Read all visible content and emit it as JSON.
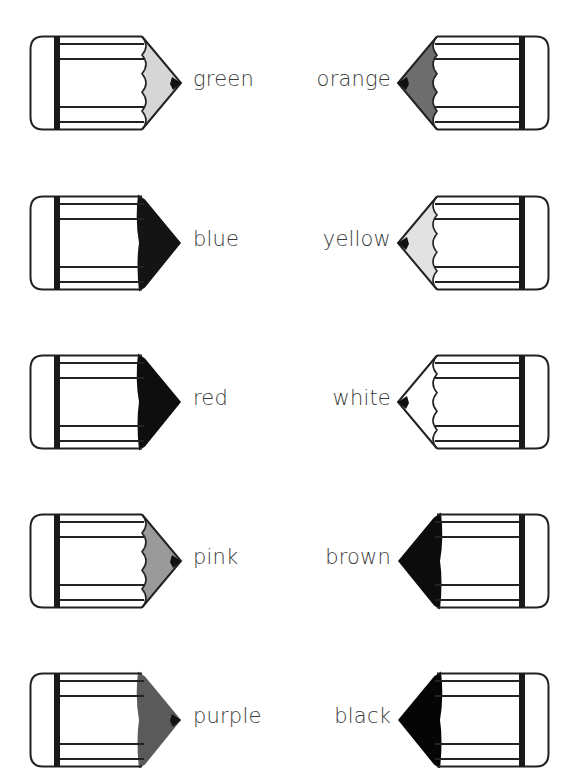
{
  "worksheet": {
    "topic": "colour words",
    "pencils": [
      {
        "label": "green",
        "side": "left",
        "row": 0,
        "tip_fill": "#d6d6d6",
        "tip_style": "scallop",
        "point": true
      },
      {
        "label": "orange",
        "side": "right",
        "row": 0,
        "tip_fill": "#6e6e6e",
        "tip_style": "scallop",
        "point": true
      },
      {
        "label": "blue",
        "side": "left",
        "row": 1,
        "tip_fill": "#141414",
        "tip_style": "scribble",
        "point": false
      },
      {
        "label": "yellow",
        "side": "right",
        "row": 1,
        "tip_fill": "#e2e2e2",
        "tip_style": "scallop",
        "point": true
      },
      {
        "label": "red",
        "side": "left",
        "row": 2,
        "tip_fill": "#0e0e0e",
        "tip_style": "scribble",
        "point": false
      },
      {
        "label": "white",
        "side": "right",
        "row": 2,
        "tip_fill": "#ffffff",
        "tip_style": "scallop",
        "point": true
      },
      {
        "label": "pink",
        "side": "left",
        "row": 3,
        "tip_fill": "#9a9a9a",
        "tip_style": "scallop",
        "point": true
      },
      {
        "label": "brown",
        "side": "right",
        "row": 3,
        "tip_fill": "#0c0c0c",
        "tip_style": "scribble",
        "point": false
      },
      {
        "label": "purple",
        "side": "left",
        "row": 4,
        "tip_fill": "#5a5a5a",
        "tip_style": "scribble",
        "point": true
      },
      {
        "label": "black",
        "side": "right",
        "row": 4,
        "tip_fill": "#050505",
        "tip_style": "scribble",
        "point": false
      }
    ]
  },
  "layout": {
    "row_centers": [
      83,
      243,
      402,
      561,
      720
    ],
    "outline_color": "#222222",
    "text_color": "#3a3a3a"
  }
}
